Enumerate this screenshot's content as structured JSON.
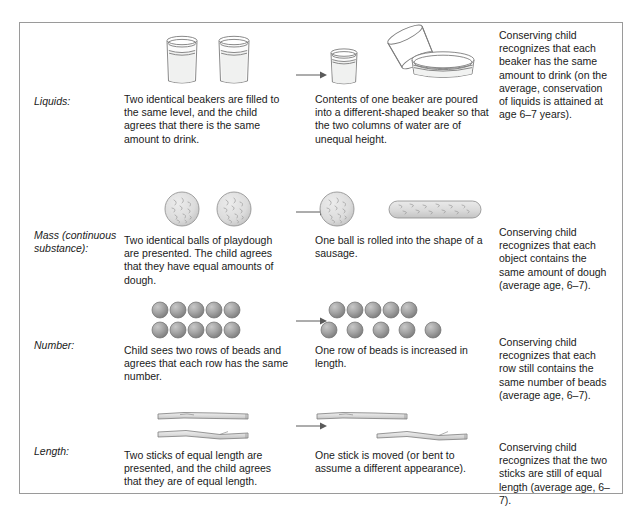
{
  "figure": {
    "border_color": "#9a9a9a",
    "background": "#ffffff",
    "ink_color": "#6e6e6e",
    "bead_color": "#a0a0a0",
    "dough_color": "#d8d8d8",
    "stick_color": "#d5d5d5"
  },
  "rows": [
    {
      "id": "liquids",
      "label": "Liquids:",
      "stage_a": {
        "art_name": "two-identical-beakers",
        "caption": "Two identical beakers are filled to the same level, and the child agrees that there is the same amount to drink."
      },
      "arrow": {
        "name": "transformation-arrow",
        "glyph": "→"
      },
      "stage_b": {
        "art_name": "beaker-poured-into-wide-dish",
        "caption": "Contents of one beaker are poured into a different-shaped beaker so that the two columns of water are of unequal height."
      },
      "outcome": "Conserving child recognizes that each beaker has the same amount to drink (on the average, conservation of liquids is attained at age 6–7 years)."
    },
    {
      "id": "mass",
      "label": "Mass (continuous substance):",
      "stage_a": {
        "art_name": "two-playdough-balls",
        "caption": "Two identical balls of playdough are presented. The child agrees that they have equal amounts of dough."
      },
      "arrow": {
        "name": "transformation-arrow",
        "glyph": "→"
      },
      "stage_b": {
        "art_name": "ball-and-sausage",
        "caption": "One ball is rolled into the shape of a sausage."
      },
      "outcome": "Conserving child recognizes that each object contains the same amount of dough (average age, 6–7)."
    },
    {
      "id": "number",
      "label": "Number:",
      "stage_a": {
        "art_name": "two-equal-bead-rows",
        "caption": "Child sees two rows of beads and agrees that each row has the same number."
      },
      "arrow": {
        "name": "transformation-arrow",
        "glyph": "→"
      },
      "stage_b": {
        "art_name": "one-bead-row-spread",
        "caption": "One row of beads is increased in length."
      },
      "outcome": "Conserving child recognizes that each row still contains the same number of beads (average age, 6–7)."
    },
    {
      "id": "length",
      "label": "Length:",
      "stage_a": {
        "art_name": "two-aligned-sticks",
        "caption": "Two sticks of equal length are presented, and the child agrees that they are of equal length."
      },
      "arrow": {
        "name": "transformation-arrow",
        "glyph": "→"
      },
      "stage_b": {
        "art_name": "one-stick-shifted",
        "caption": "One stick is moved (or bent to assume a different appearance)."
      },
      "outcome": "Conserving child recognizes that the two sticks are still of equal length (average age, 6–7)."
    }
  ]
}
